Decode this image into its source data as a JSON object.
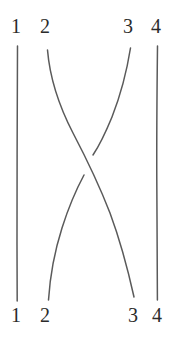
{
  "figure": {
    "kind": "braid-diagram",
    "width": 182,
    "height": 338,
    "background_color": "#ffffff",
    "ink_color": "#5a5a5a",
    "label_color": "#2b2b2b",
    "stroke_width": 1.5
  },
  "top_labels": [
    {
      "text": "1",
      "x": 16
    },
    {
      "text": "2",
      "x": 45
    },
    {
      "text": "3",
      "x": 128
    },
    {
      "text": "4",
      "x": 156
    }
  ],
  "bottom_labels": [
    {
      "text": "1",
      "x": 16
    },
    {
      "text": "2",
      "x": 45
    },
    {
      "text": "3",
      "x": 133
    },
    {
      "text": "4",
      "x": 157
    }
  ],
  "strands": [
    {
      "name": "strand-1",
      "from_label": "1",
      "to_label": "1",
      "kind": "vertical",
      "crossing_role": "none",
      "path": "M 17.5 46 C 17.2 110, 17.0 180, 17.0 245 C 17.0 270, 17.1 288, 17.2 301"
    },
    {
      "name": "strand-2",
      "from_label": "2",
      "to_label": "3",
      "kind": "diagonal-over",
      "crossing_role": "over",
      "path": "M 47.5 50 C 49.5 74, 58 104, 73 133 C 84 154, 98 182, 110 213 C 120 240, 128 270, 134 297"
    },
    {
      "name": "strand-3-upper",
      "from_label": "3",
      "to_label": "crossing",
      "kind": "diagonal-under",
      "crossing_role": "under",
      "path": "M 130.5 48 C 127 70, 121 94, 112 117 C 105 134, 99 146, 93 155"
    },
    {
      "name": "strand-3-lower",
      "from_label": "crossing",
      "to_label": "2",
      "kind": "diagonal-under",
      "crossing_role": "under",
      "path": "M 84 175 C 77 188, 69 206, 62 228 C 55 250, 50 277, 48.5 300"
    },
    {
      "name": "strand-4",
      "from_label": "4",
      "to_label": "4",
      "kind": "vertical",
      "crossing_role": "none",
      "path": "M 157.5 46 C 157.0 90, 156.6 135, 156.8 180 C 157.0 220, 157.3 265, 157.4 300"
    }
  ],
  "crossing": {
    "name": "crossing-2-3",
    "center_x": 88,
    "center_y": 165,
    "over_strand": "strand-2",
    "under_strand": "strand-3",
    "gap_description": "break in the under strand where strand 2 passes over"
  }
}
